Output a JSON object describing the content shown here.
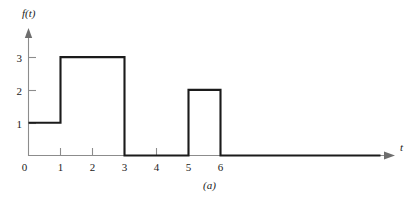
{
  "figure": {
    "caption": "(a)",
    "y_axis_title": "f(t)",
    "x_axis_title": "t"
  },
  "chart_data": {
    "type": "line",
    "subtype": "step-piecewise-constant",
    "title": "",
    "subtitle": "",
    "xlabel": "t",
    "ylabel": "f(t)",
    "xlim": [
      0,
      11
    ],
    "ylim": [
      0,
      3.6
    ],
    "grid": false,
    "legend": null,
    "x_ticks": [
      0,
      1,
      2,
      3,
      4,
      5,
      6
    ],
    "x_tick_labels": [
      "0",
      "1",
      "2",
      "3",
      "4",
      "5",
      "6"
    ],
    "y_ticks": [
      1,
      2,
      3
    ],
    "y_tick_labels": [
      "1",
      "2",
      "3"
    ],
    "line_color": "#1b1b1b",
    "axis_color": "#8c8c8c",
    "segments": [
      {
        "x_start": 0,
        "x_end": 1,
        "value": 1
      },
      {
        "x_start": 1,
        "x_end": 3,
        "value": 3
      },
      {
        "x_start": 3,
        "x_end": 5,
        "value": 0
      },
      {
        "x_start": 5,
        "x_end": 6,
        "value": 2
      },
      {
        "x_start": 6,
        "x_end": 11,
        "value": 0
      }
    ],
    "x": [
      0,
      1,
      1,
      3,
      3,
      5,
      5,
      6,
      6,
      11
    ],
    "values": [
      1,
      1,
      3,
      3,
      0,
      0,
      2,
      2,
      0,
      0
    ]
  }
}
